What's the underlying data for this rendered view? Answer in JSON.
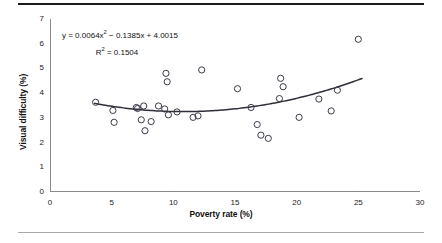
{
  "figure": {
    "top_rule_color": "#1b1b1b",
    "bottom_rule_color": "#a9a9a9",
    "background": "#ffffff"
  },
  "annotations": {
    "regression_equation": "y = 0.0064x² − 0.1385x + 4.0015",
    "r_squared": "R² = 0.1504"
  },
  "chart_data": {
    "type": "scatter",
    "title": "",
    "xlabel": "Poverty rate (%)",
    "ylabel": "Visual difficulty (%)",
    "xlim": [
      0,
      30
    ],
    "ylim": [
      0,
      7
    ],
    "xticks": [
      0,
      5,
      10,
      15,
      20,
      25,
      30
    ],
    "yticks": [
      0,
      1,
      2,
      3,
      4,
      5,
      6,
      7
    ],
    "grid": false,
    "legend": false,
    "marker": {
      "style": "open-circle",
      "edge_color": "#3b3b4a",
      "fill_color": "none",
      "radius_px": 3.1
    },
    "trendline": {
      "type": "polynomial",
      "order": 2,
      "equation_text": "y = 0.0064x² − 0.1385x + 4.0015",
      "r_squared_text": "R² = 0.1504",
      "coefficients": {
        "a": 0.0064,
        "b": -0.1385,
        "c": 4.0015
      },
      "r_squared": 0.1504,
      "x_start": 3.6,
      "x_end": 25.3,
      "color": "#2e2e38",
      "width_px": 1.5
    },
    "points": [
      {
        "x": 3.7,
        "y": 3.63
      },
      {
        "x": 5.1,
        "y": 3.3
      },
      {
        "x": 5.2,
        "y": 2.82
      },
      {
        "x": 7.0,
        "y": 3.42
      },
      {
        "x": 7.1,
        "y": 3.38
      },
      {
        "x": 7.4,
        "y": 2.92
      },
      {
        "x": 7.6,
        "y": 3.48
      },
      {
        "x": 7.7,
        "y": 2.48
      },
      {
        "x": 8.2,
        "y": 2.85
      },
      {
        "x": 8.8,
        "y": 3.48
      },
      {
        "x": 9.3,
        "y": 3.36
      },
      {
        "x": 9.4,
        "y": 4.8
      },
      {
        "x": 9.5,
        "y": 4.46
      },
      {
        "x": 9.6,
        "y": 3.12
      },
      {
        "x": 10.3,
        "y": 3.24
      },
      {
        "x": 11.6,
        "y": 3.02
      },
      {
        "x": 12.0,
        "y": 3.08
      },
      {
        "x": 12.3,
        "y": 4.94
      },
      {
        "x": 15.2,
        "y": 4.18
      },
      {
        "x": 16.3,
        "y": 3.42
      },
      {
        "x": 16.8,
        "y": 2.73
      },
      {
        "x": 17.1,
        "y": 2.3
      },
      {
        "x": 17.7,
        "y": 2.17
      },
      {
        "x": 18.6,
        "y": 3.78
      },
      {
        "x": 18.7,
        "y": 4.6
      },
      {
        "x": 18.9,
        "y": 4.26
      },
      {
        "x": 20.2,
        "y": 3.02
      },
      {
        "x": 21.8,
        "y": 3.76
      },
      {
        "x": 22.8,
        "y": 3.28
      },
      {
        "x": 23.3,
        "y": 4.12
      },
      {
        "x": 25.0,
        "y": 6.18
      }
    ]
  }
}
